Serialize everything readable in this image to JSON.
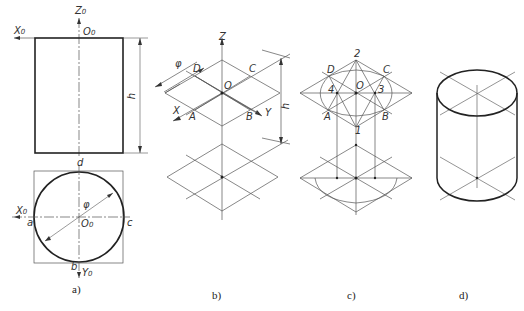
{
  "figure": {
    "panels": [
      {
        "id": "a",
        "caption": "a)",
        "description": "Orthographic views of cylinder (front view rectangle and top view circle)",
        "labels": {
          "z_axis": "Z",
          "z_sub": "0",
          "x_axis_front": "X",
          "x_sub_front": "0",
          "origin_front": "O",
          "origin_front_sub": "0",
          "height": "h",
          "point_d": "d",
          "point_a": "a",
          "point_c": "c",
          "point_b": "b",
          "diameter": "φ",
          "x_axis_top": "X",
          "x_sub_top": "0",
          "origin_top": "O",
          "origin_top_sub": "0",
          "y_axis": "Y",
          "y_sub": "0"
        }
      },
      {
        "id": "b",
        "caption": "b)",
        "description": "Isometric axes with circumscribed rhombi of top and bottom faces",
        "labels": {
          "z_axis": "Z",
          "diameter": "φ",
          "point_D": "D",
          "point_C": "C",
          "origin": "O",
          "x_axis": "X",
          "point_A": "A",
          "point_B": "B",
          "y_axis": "Y",
          "height": "h"
        }
      },
      {
        "id": "c",
        "caption": "c)",
        "description": "Four-center approximate ellipse construction",
        "labels": {
          "center_2": "2",
          "point_D": "D",
          "point_C": "C",
          "center_4": "4",
          "origin": "O",
          "center_3": "3",
          "point_A": "A",
          "point_B": "B",
          "center_1": "1"
        }
      },
      {
        "id": "d",
        "caption": "d)",
        "description": "Finished isometric drawing of the cylinder"
      }
    ],
    "colors": {
      "thick_line": "#222222",
      "thin_line": "#666666",
      "background": "#ffffff"
    }
  }
}
